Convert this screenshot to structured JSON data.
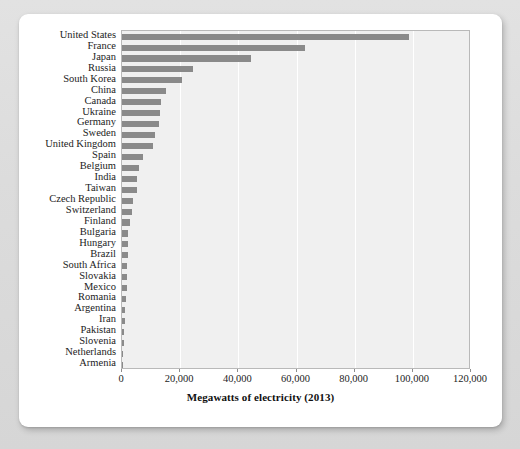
{
  "chart_data": {
    "type": "bar",
    "orientation": "horizontal",
    "title": "",
    "xlabel": "Megawatts of electricity (2013)",
    "ylabel": "",
    "xlim": [
      0,
      120000
    ],
    "xticks": [
      0,
      20000,
      40000,
      60000,
      80000,
      100000,
      120000
    ],
    "xtick_labels": [
      "0",
      "20,000",
      "40,000",
      "60,000",
      "80,000",
      "100,000",
      "120,000"
    ],
    "grid": true,
    "grid_axis": "x",
    "legend": false,
    "bar_color": "#8a8a8a",
    "plot_background": "#f0f0f0",
    "gridline_color": "#ffffff",
    "categories": [
      "United States",
      "France",
      "Japan",
      "Russia",
      "South Korea",
      "China",
      "Canada",
      "Ukraine",
      "Germany",
      "Sweden",
      "United Kingdom",
      "Spain",
      "Belgium",
      "India",
      "Taiwan",
      "Czech Republic",
      "Switzerland",
      "Finland",
      "Bulgaria",
      "Hungary",
      "Brazil",
      "South Africa",
      "Slovakia",
      "Mexico",
      "Romania",
      "Argentina",
      "Iran",
      "Pakistan",
      "Slovenia",
      "Netherlands",
      "Armenia"
    ],
    "values": [
      98700,
      63000,
      44200,
      24300,
      20700,
      15000,
      13500,
      13100,
      12700,
      11500,
      10700,
      7100,
      5900,
      5300,
      5000,
      3900,
      3300,
      2750,
      2000,
      1900,
      1900,
      1860,
      1820,
      1600,
      1410,
      1010,
      920,
      730,
      690,
      490,
      380
    ],
    "value_unit": "Megawatts"
  },
  "axis": {
    "title": "Megawatts of electricity (2013)"
  }
}
